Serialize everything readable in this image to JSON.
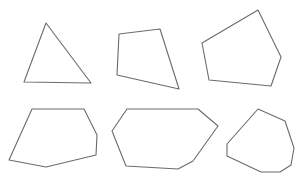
{
  "canvas": {
    "width": 302,
    "height": 184,
    "background": "#ffffff",
    "stroke": "#6b6b6b"
  },
  "shapes": [
    {
      "name": "triangle",
      "sides": 3,
      "points": "46,23 91,83 24,82"
    },
    {
      "name": "quadrilateral",
      "sides": 4,
      "points": "119,34 160,29 179,89 117,75"
    },
    {
      "name": "pentagon",
      "sides": 5,
      "points": "258,10 281,57 271,86 209,80 202,43"
    },
    {
      "name": "hexagon",
      "sides": 6,
      "points": "32,109 84,109 97,135 96,155 46,167 9,160"
    },
    {
      "name": "heptagon",
      "sides": 7,
      "points": "127,109 198,109 218,126 193,161 178,169 126,166 112,131"
    },
    {
      "name": "octagon",
      "sides": 8,
      "points": "258,109 285,121 294,148 291,165 280,172 261,172 227,156 227,144"
    }
  ]
}
